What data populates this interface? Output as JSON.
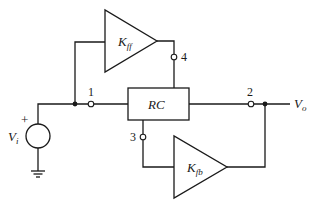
{
  "diagram": {
    "title": "",
    "type": "circuit block diagram",
    "colors": {
      "line": "#1a1a1a",
      "background": "#ffffff"
    },
    "blocks": {
      "rc": {
        "label": "RC"
      },
      "kff": {
        "label_main": "K",
        "label_sub": "ff"
      },
      "kfb": {
        "label_main": "K",
        "label_sub": "fb"
      }
    },
    "source": {
      "label_main": "V",
      "label_sub": "i",
      "polarity": "+"
    },
    "output": {
      "label_main": "V",
      "label_sub": "o"
    },
    "nodes": [
      {
        "id": "1",
        "label": "1"
      },
      {
        "id": "2",
        "label": "2"
      },
      {
        "id": "3",
        "label": "3"
      },
      {
        "id": "4",
        "label": "4"
      }
    ]
  }
}
